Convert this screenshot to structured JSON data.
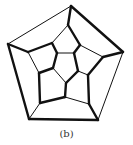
{
  "figure": {
    "caption": "(b)",
    "colors": {
      "line": "#111111",
      "background": "#ffffff",
      "caption": "#333333"
    },
    "vertices": {
      "O0": [
        71,
        6
      ],
      "O1": [
        123,
        52
      ],
      "O2": [
        98,
        120
      ],
      "O3": [
        29,
        119
      ],
      "O4": [
        8,
        44
      ],
      "M0": [
        68,
        25
      ],
      "M1": [
        80,
        45
      ],
      "M2": [
        103,
        57
      ],
      "M3": [
        88,
        75
      ],
      "M4": [
        89,
        104
      ],
      "M5": [
        65,
        97
      ],
      "M6": [
        40,
        103
      ],
      "M7": [
        39,
        73
      ],
      "M8": [
        28,
        52
      ],
      "M9": [
        52,
        43
      ],
      "I0": [
        57,
        53
      ],
      "I1": [
        74,
        53
      ],
      "I2": [
        78,
        71
      ],
      "I3": [
        66,
        83
      ],
      "I4": [
        53,
        68
      ]
    },
    "edges": [
      [
        "O0",
        "O1",
        "thick"
      ],
      [
        "O1",
        "O2",
        "thin"
      ],
      [
        "O2",
        "O3",
        "thick"
      ],
      [
        "O3",
        "O4",
        "thick"
      ],
      [
        "O4",
        "O0",
        "thin"
      ],
      [
        "O0",
        "M0",
        "thick"
      ],
      [
        "O1",
        "M2",
        "thick"
      ],
      [
        "O2",
        "M4",
        "thick"
      ],
      [
        "O3",
        "M6",
        "thin"
      ],
      [
        "O4",
        "M8",
        "thick"
      ],
      [
        "M0",
        "M1",
        "thick"
      ],
      [
        "M1",
        "M2",
        "thin"
      ],
      [
        "M2",
        "M3",
        "thick"
      ],
      [
        "M3",
        "M4",
        "thick"
      ],
      [
        "M4",
        "M5",
        "thin"
      ],
      [
        "M5",
        "M6",
        "thick"
      ],
      [
        "M6",
        "M7",
        "thick"
      ],
      [
        "M7",
        "M8",
        "thin"
      ],
      [
        "M8",
        "M9",
        "thick"
      ],
      [
        "M9",
        "M0",
        "thin"
      ],
      [
        "M9",
        "I0",
        "thick"
      ],
      [
        "M1",
        "I1",
        "thick"
      ],
      [
        "M3",
        "I2",
        "thin"
      ],
      [
        "M5",
        "I3",
        "thick"
      ],
      [
        "M7",
        "I4",
        "thick"
      ],
      [
        "I0",
        "I1",
        "thin"
      ],
      [
        "I1",
        "I2",
        "thick"
      ],
      [
        "I2",
        "I3",
        "thick"
      ],
      [
        "I3",
        "I4",
        "thin"
      ],
      [
        "I4",
        "I0",
        "thick"
      ]
    ]
  }
}
